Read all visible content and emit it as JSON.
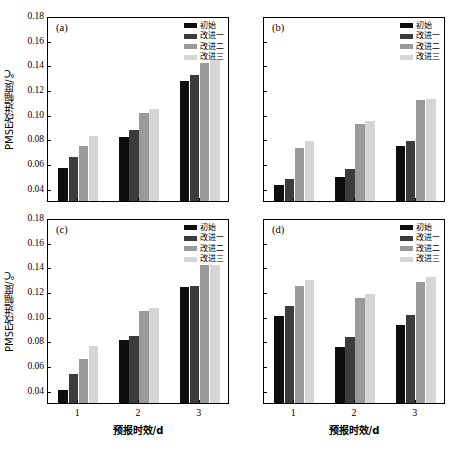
{
  "figure": {
    "panels": [
      "a",
      "b",
      "c",
      "d"
    ],
    "panel_label_a": "(a)",
    "panel_label_b": "(b)",
    "panel_label_c": "(c)",
    "panel_label_d": "(d)"
  },
  "axes": {
    "ylabel": "PMSE改进幅度/℃",
    "xlabel": "预报时效/d",
    "yticks": [
      "0.18",
      "0.16",
      "0.14",
      "0.12",
      "0.10",
      "0.08",
      "0.06",
      "0.04"
    ],
    "xticks": [
      "1",
      "2",
      "3"
    ]
  },
  "legend": {
    "items": [
      {
        "label": "初始",
        "color": "#0d0d0d"
      },
      {
        "label": "改进一",
        "color": "#3c3c3c"
      },
      {
        "label": "改进二",
        "color": "#9a9a9a"
      },
      {
        "label": "改进三",
        "color": "#d6d6d6"
      }
    ]
  },
  "chart_data": [
    {
      "type": "bar",
      "panel": "(a)",
      "title": "",
      "xlabel": "预报时效/d",
      "ylabel": "PMSE改进幅度/℃",
      "ylim": [
        0.03,
        0.18
      ],
      "categories": [
        "1",
        "2",
        "3"
      ],
      "series": [
        {
          "name": "初始",
          "values": [
            0.0565,
            0.082,
            0.1275
          ]
        },
        {
          "name": "改进一",
          "values": [
            0.066,
            0.0875,
            0.132
          ]
        },
        {
          "name": "改进二",
          "values": [
            0.0745,
            0.1015,
            0.1415
          ]
        },
        {
          "name": "改进三",
          "values": [
            0.0825,
            0.105,
            0.1445
          ]
        }
      ],
      "grid": false,
      "legend_position": "top-right"
    },
    {
      "type": "bar",
      "panel": "(b)",
      "title": "",
      "xlabel": "预报时效/d",
      "ylabel": "PMSE改进幅度/℃",
      "ylim": [
        0.03,
        0.18
      ],
      "categories": [
        "1",
        "2",
        "3"
      ],
      "series": [
        {
          "name": "初始",
          "values": [
            0.043,
            0.0495,
            0.075
          ]
        },
        {
          "name": "改进一",
          "values": [
            0.048,
            0.056,
            0.079
          ]
        },
        {
          "name": "改进二",
          "values": [
            0.073,
            0.0925,
            0.112
          ]
        },
        {
          "name": "改进三",
          "values": [
            0.0785,
            0.0945,
            0.113
          ]
        }
      ],
      "grid": false,
      "legend_position": "top-right"
    },
    {
      "type": "bar",
      "panel": "(c)",
      "title": "",
      "xlabel": "预报时效/d",
      "ylabel": "PMSE改进幅度/℃",
      "ylim": [
        0.03,
        0.18
      ],
      "categories": [
        "1",
        "2",
        "3"
      ],
      "series": [
        {
          "name": "初始",
          "values": [
            0.0405,
            0.081,
            0.124
          ]
        },
        {
          "name": "改进一",
          "values": [
            0.0535,
            0.0845,
            0.125
          ]
        },
        {
          "name": "改进二",
          "values": [
            0.0655,
            0.105,
            0.1415
          ]
        },
        {
          "name": "改进三",
          "values": [
            0.076,
            0.107,
            0.142
          ]
        }
      ],
      "grid": false,
      "legend_position": "top-right"
    },
    {
      "type": "bar",
      "panel": "(d)",
      "title": "",
      "xlabel": "预报时效/d",
      "ylabel": "PMSE改进幅度/℃",
      "ylim": [
        0.03,
        0.18
      ],
      "categories": [
        "1",
        "2",
        "3"
      ],
      "series": [
        {
          "name": "初始",
          "values": [
            0.1005,
            0.0755,
            0.0935
          ]
        },
        {
          "name": "改进一",
          "values": [
            0.1085,
            0.0835,
            0.101
          ]
        },
        {
          "name": "改进二",
          "values": [
            0.125,
            0.1155,
            0.1285
          ]
        },
        {
          "name": "改进三",
          "values": [
            0.1295,
            0.1185,
            0.132
          ]
        }
      ],
      "grid": false,
      "legend_position": "top-right"
    }
  ]
}
